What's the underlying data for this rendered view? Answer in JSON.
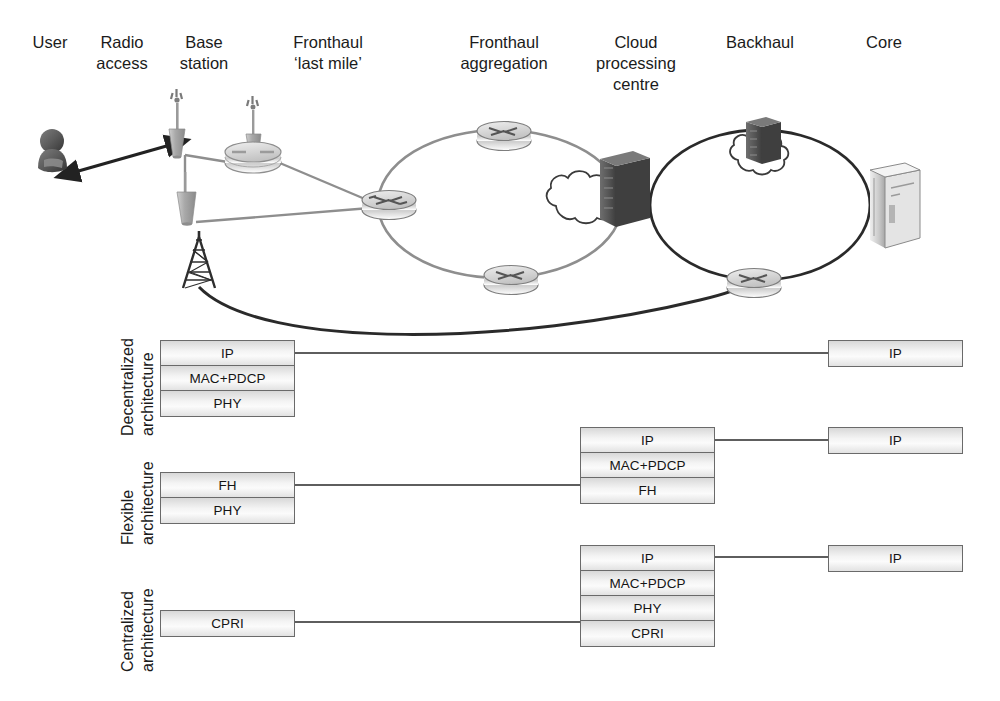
{
  "diagram": {
    "columns": [
      {
        "id": "user",
        "label": "User"
      },
      {
        "id": "radio-access",
        "label": "Radio\naccess"
      },
      {
        "id": "base-station",
        "label": "Base\nstation"
      },
      {
        "id": "fronthaul-last-mile",
        "label": "Fronthaul\n‘last mile’"
      },
      {
        "id": "fronthaul-aggregation",
        "label": "Fronthaul\naggregation"
      },
      {
        "id": "cloud-processing-centre",
        "label": "Cloud\nprocessing\ncentre"
      },
      {
        "id": "backhaul",
        "label": "Backhaul"
      },
      {
        "id": "core",
        "label": "Core"
      }
    ],
    "nodes": [
      {
        "id": "user-figure",
        "type": "user-silhouette",
        "label": ""
      },
      {
        "id": "antenna-1",
        "type": "small-cell-antenna",
        "label": ""
      },
      {
        "id": "antenna-2",
        "type": "small-cell-antenna",
        "label": ""
      },
      {
        "id": "antenna-3",
        "type": "small-cell-antenna",
        "label": ""
      },
      {
        "id": "remote-radio-hub",
        "type": "hub",
        "label": ""
      },
      {
        "id": "macro-mast",
        "type": "lattice-mast",
        "label": ""
      },
      {
        "id": "router-aggregation",
        "type": "router",
        "label": ""
      },
      {
        "id": "router-ring-top",
        "type": "router",
        "label": ""
      },
      {
        "id": "router-ring-bottom",
        "type": "router",
        "label": ""
      },
      {
        "id": "cloud-processing",
        "type": "cloud-with-server",
        "label": ""
      },
      {
        "id": "backhaul-cloud",
        "type": "cloud-with-server",
        "label": ""
      },
      {
        "id": "router-backhaul",
        "type": "router",
        "label": ""
      },
      {
        "id": "core-server",
        "type": "server-cabinet",
        "label": ""
      }
    ],
    "architectures": [
      {
        "id": "decentralized",
        "label": "Decentralized\narchitecture",
        "label_lines": [
          "Decentralized",
          "architecture"
        ],
        "base_station_stack": [
          "IP",
          "MAC+PDCP",
          "PHY"
        ],
        "centre_stack": [],
        "core_stack": [
          "IP"
        ]
      },
      {
        "id": "flexible",
        "label": "Flexible\narchitecture",
        "label_lines": [
          "Flexible",
          "architecture"
        ],
        "base_station_stack": [
          "FH",
          "PHY"
        ],
        "centre_stack": [
          "IP",
          "MAC+PDCP",
          "FH"
        ],
        "core_stack": [
          "IP"
        ]
      },
      {
        "id": "centralized",
        "label": "Centralized\narchitecture",
        "label_lines": [
          "Centralized",
          "architecture"
        ],
        "base_station_stack": [
          "CPRI"
        ],
        "centre_stack": [
          "IP",
          "MAC+PDCP",
          "PHY",
          "CPRI"
        ],
        "core_stack": [
          "IP"
        ]
      }
    ],
    "colors": {
      "line_light": "#8e8e8e",
      "line_dark": "#2a2a2a",
      "box_border": "#6a6a6a",
      "text": "#1b1b1b",
      "background": "#ffffff"
    }
  }
}
